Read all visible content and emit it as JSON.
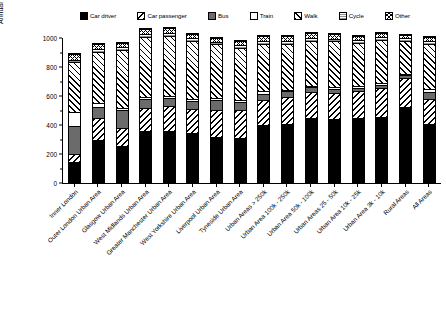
{
  "chart_data": {
    "type": "bar",
    "subtype": "stacked-bar",
    "title": "",
    "xlabel": "",
    "ylabel": "Annual trips travelled per individual (trips)",
    "ylim": [
      0,
      1000
    ],
    "yticks": [
      0,
      200,
      400,
      600,
      800,
      1000
    ],
    "ytick_labels": [
      "0",
      "200",
      "400",
      "600",
      "800",
      "1000"
    ],
    "grid": false,
    "legend_position": "top",
    "categories": [
      "Inner London",
      "Outer London Urban Area",
      "Glasgow Urban Area",
      "West Midlands Urban Area",
      "Greater Manchester Urban Area",
      "West Yorkshire Urban Area",
      "Liverpool Urban Area",
      "Tyneside Urban Area",
      "Urban Areas > 250k",
      "Urban Area 100k - 250k",
      "Urban Area 50k - 100k",
      "Urban Areas 25 - 50k",
      "Urban Area 10k - 25k",
      "Urban Area 3k - 10k",
      "Rural Areas",
      "All Areas"
    ],
    "series": [
      {
        "name": "Car driver",
        "color": "#000000",
        "pattern": "solid-black",
        "values": [
          135,
          290,
          250,
          350,
          355,
          340,
          310,
          305,
          390,
          400,
          440,
          435,
          440,
          450,
          520,
          400
        ]
      },
      {
        "name": "Car passenger",
        "color": "#ffffff",
        "pattern": "diagonal-hatch-left",
        "values": [
          60,
          150,
          120,
          160,
          170,
          165,
          185,
          190,
          175,
          185,
          180,
          180,
          185,
          195,
          200,
          175
        ]
      },
      {
        "name": "Bus",
        "color": "#6b6b6b",
        "pattern": "solid-grey",
        "values": [
          190,
          75,
          125,
          60,
          55,
          55,
          70,
          60,
          45,
          40,
          35,
          30,
          25,
          25,
          15,
          45
        ]
      },
      {
        "name": "Train",
        "color": "#ffffff",
        "pattern": "solid-white",
        "values": [
          95,
          30,
          15,
          15,
          15,
          15,
          15,
          10,
          15,
          10,
          10,
          10,
          10,
          10,
          10,
          20
        ]
      },
      {
        "name": "Walk",
        "color": "#ffffff",
        "pattern": "diagonal-hatch-right",
        "values": [
          350,
          355,
          400,
          415,
          410,
          395,
          370,
          360,
          330,
          320,
          310,
          315,
          300,
          300,
          230,
          310
        ]
      },
      {
        "name": "Cycle",
        "color": "#ffffff",
        "pattern": "horizontal-lines",
        "values": [
          15,
          15,
          20,
          20,
          20,
          20,
          15,
          20,
          20,
          20,
          20,
          20,
          20,
          20,
          15,
          20
        ]
      },
      {
        "name": "Other",
        "color": "#ffffff",
        "pattern": "crosshatch",
        "values": [
          35,
          35,
          30,
          35,
          35,
          30,
          30,
          30,
          30,
          30,
          30,
          30,
          30,
          30,
          25,
          30
        ]
      }
    ],
    "totals": [
      880,
      950,
      960,
      1055,
      1060,
      1020,
      995,
      975,
      1005,
      1005,
      1025,
      1020,
      1010,
      1030,
      1015,
      1000
    ]
  },
  "legend": {
    "items": [
      {
        "label": "Car driver",
        "swatch": "swatch-car-driver"
      },
      {
        "label": "Car passenger",
        "swatch": "swatch-car-passenger"
      },
      {
        "label": "Bus",
        "swatch": "swatch-bus"
      },
      {
        "label": "Train",
        "swatch": "swatch-train"
      },
      {
        "label": "Walk",
        "swatch": "swatch-walk"
      },
      {
        "label": "Cycle",
        "swatch": "swatch-cycle"
      },
      {
        "label": "Other",
        "swatch": "swatch-other"
      }
    ]
  }
}
